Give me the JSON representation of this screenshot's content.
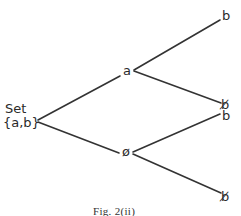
{
  "figure": {
    "caption": "Fig. 2(ii)",
    "root": {
      "line1": "Set",
      "line2": "{a,b}"
    },
    "nodes": {
      "a_node": "a",
      "not_a_node": "ø"
    },
    "leaves": {
      "a_b": "b",
      "a_not_b": "b̸",
      "not_a_b": "b",
      "not_a_not_b": "b̸"
    },
    "line_color": "#333333"
  }
}
